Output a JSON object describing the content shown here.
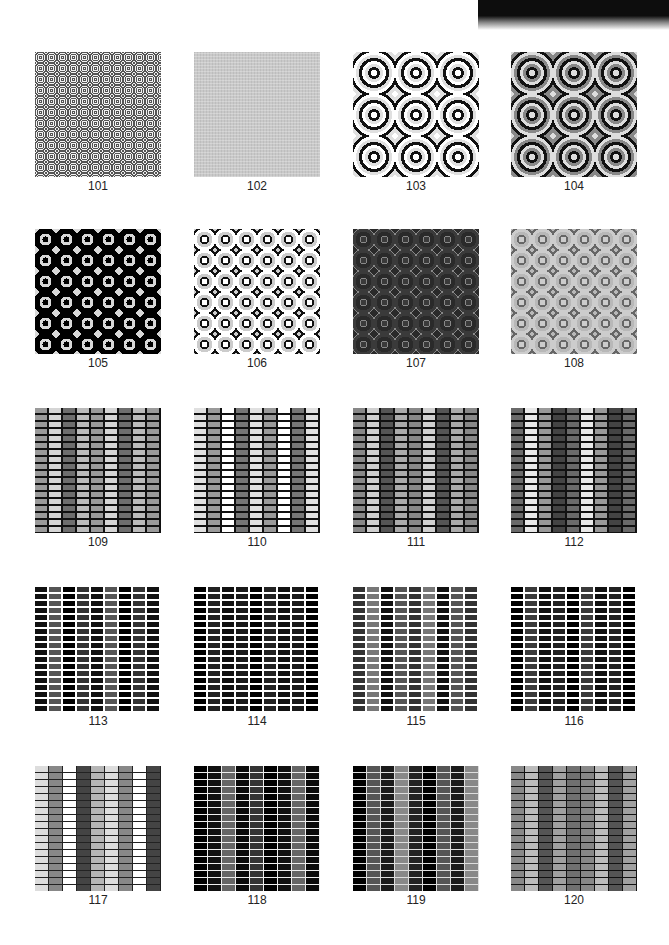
{
  "page": {
    "header_strip": "dark-decorative-strip",
    "columns_x": [
      35,
      194,
      353,
      511
    ],
    "rows_y": [
      52,
      229,
      408,
      587,
      766
    ]
  },
  "tiles": [
    {
      "id": "101",
      "pattern": "fine-grey-swirl"
    },
    {
      "id": "102",
      "pattern": "light-grey-swirl"
    },
    {
      "id": "103",
      "pattern": "black-white-swirl-large"
    },
    {
      "id": "104",
      "pattern": "dark-grey-swirl-large"
    },
    {
      "id": "105",
      "pattern": "black-on-white-swirl"
    },
    {
      "id": "106",
      "pattern": "white-black-outline-swirl"
    },
    {
      "id": "107",
      "pattern": "dark-grey-swirl-thin"
    },
    {
      "id": "108",
      "pattern": "mid-grey-swirl"
    },
    {
      "id": "109",
      "pattern": "grey-brick-black-mortar"
    },
    {
      "id": "110",
      "pattern": "light-brick-black-mortar"
    },
    {
      "id": "111",
      "pattern": "mixed-brick-black-mortar"
    },
    {
      "id": "112",
      "pattern": "contrast-brick-black-mortar"
    },
    {
      "id": "113",
      "pattern": "dark-brick-white-mortar"
    },
    {
      "id": "114",
      "pattern": "black-brick-white-mortar"
    },
    {
      "id": "115",
      "pattern": "grey-brick-white-mortar"
    },
    {
      "id": "116",
      "pattern": "black-brick-white-mortar-2"
    },
    {
      "id": "117",
      "pattern": "light-mixed-brick"
    },
    {
      "id": "118",
      "pattern": "black-brick-light-mortar"
    },
    {
      "id": "119",
      "pattern": "dark-mixed-brick"
    },
    {
      "id": "120",
      "pattern": "grey-mixed-brick"
    }
  ]
}
